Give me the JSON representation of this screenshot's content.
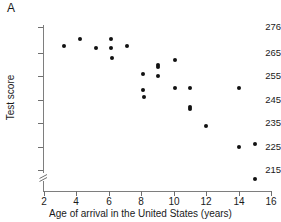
{
  "figure": {
    "panel_label": "A",
    "background_color": "#ffffff",
    "point_color": "#111111",
    "axis_color": "#7e7e7e"
  },
  "chart_data": {
    "type": "scatter",
    "title": "",
    "panel_label": "A",
    "xlabel": "Age of arrival in the United States (years)",
    "ylabel": "Test score",
    "xlim": [
      2,
      16
    ],
    "ylim": [
      215,
      276
    ],
    "y_axis_break": true,
    "grid": false,
    "legend": null,
    "xticks": [
      2,
      4,
      6,
      8,
      10,
      12,
      14,
      16
    ],
    "xtick_labels": [
      "2",
      "4",
      "6",
      "8",
      "10",
      "12",
      "14",
      "16"
    ],
    "yticks": [
      215,
      225,
      235,
      245,
      255,
      265,
      276
    ],
    "ytick_labels": [
      "215",
      "225",
      "235",
      "245",
      "255",
      "265",
      "276"
    ],
    "series": [
      {
        "name": "Test score by age of arrival",
        "x": [
          3.2,
          4.2,
          5.2,
          6.1,
          6.15,
          6.2,
          7.1,
          8.1,
          8.1,
          8.15,
          9.0,
          9.0,
          9.05,
          10.1,
          10.1,
          11.0,
          11.0,
          11.0,
          12.0,
          14.0,
          14.0,
          15.0,
          15.0
        ],
        "y": [
          268,
          271,
          267,
          271,
          267,
          263,
          268,
          256,
          249,
          246,
          260,
          259,
          255,
          262,
          250,
          250,
          242,
          241,
          234,
          250,
          225,
          226,
          211
        ]
      }
    ],
    "n_points": 23,
    "trend": "negative"
  }
}
